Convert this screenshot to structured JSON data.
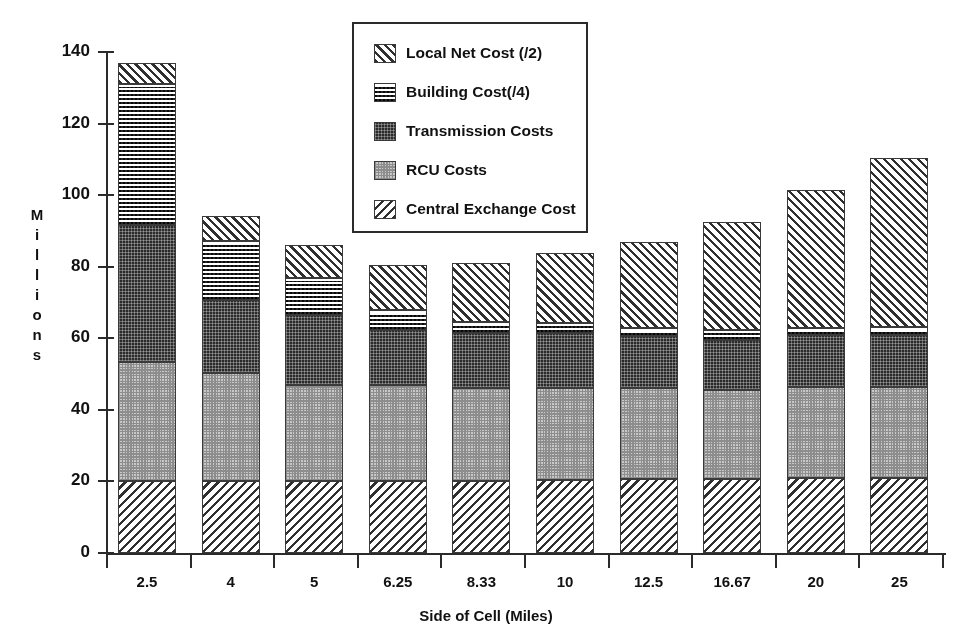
{
  "chart_data": {
    "type": "bar",
    "subtype": "stacked-bar",
    "title": "",
    "xlabel": "Side of Cell (Miles)",
    "ylabel": "Millions",
    "categories": [
      "2.5",
      "4",
      "5",
      "6.25",
      "8.33",
      "10",
      "12.5",
      "16.67",
      "20",
      "25"
    ],
    "ylim": [
      0,
      140
    ],
    "yticks": [
      0,
      20,
      40,
      60,
      80,
      100,
      120,
      140
    ],
    "grid": false,
    "legend_position": "top-center",
    "series": [
      {
        "name": "Central Exchange Cost",
        "pattern": "diagonal-hatch-back",
        "values": [
          20,
          20,
          20,
          20,
          20,
          20.5,
          20.7,
          20.7,
          20.9,
          21
        ]
      },
      {
        "name": "RCU Costs",
        "pattern": "fine-dot-light",
        "values": [
          33.4,
          30.3,
          26.9,
          26.9,
          26.1,
          25.6,
          25.4,
          24.8,
          25.5,
          25.4
        ]
      },
      {
        "name": "Transmission Costs",
        "pattern": "dense-dot-dark",
        "values": [
          38.2,
          20.4,
          19.6,
          15.4,
          15.4,
          15.4,
          14.5,
          14.0,
          14.5,
          14.5
        ]
      },
      {
        "name": "Building Cost(/4)",
        "pattern": "checkerboard",
        "values": [
          39.4,
          16.5,
          10.3,
          5.6,
          3.0,
          2.7,
          2.2,
          2.8,
          1.9,
          2.2
        ]
      },
      {
        "name": "Local Net Cost (/2)",
        "pattern": "diagonal-hatch-fwd",
        "values": [
          6.0,
          6.9,
          9.2,
          12.5,
          16.5,
          19.6,
          24.1,
          30.2,
          38.6,
          47.2
        ]
      }
    ],
    "totals": [
      137.0,
      94.1,
      86.0,
      80.4,
      81.0,
      83.8,
      86.9,
      92.5,
      101.4,
      110.3
    ]
  },
  "legend": {
    "items": [
      {
        "label": "Local Net Cost (/2)",
        "pattern": "diagonal-hatch-fwd"
      },
      {
        "label": "Building Cost(/4)",
        "pattern": "checkerboard"
      },
      {
        "label": "Transmission Costs",
        "pattern": "dense-dot-dark"
      },
      {
        "label": "RCU Costs",
        "pattern": "fine-dot-light"
      },
      {
        "label": "Central Exchange Cost",
        "pattern": "diagonal-hatch-back"
      }
    ]
  },
  "axes": {
    "y_title_letters": [
      "M",
      "i",
      "l",
      "l",
      "i",
      "o",
      "n",
      "s"
    ],
    "y_tick_labels": [
      "140",
      "120",
      "100",
      "80",
      "60",
      "40",
      "20",
      "0"
    ],
    "x_tick_labels": [
      "2.5",
      "4",
      "5",
      "6.25",
      "8.33",
      "10",
      "12.5",
      "16.67",
      "20",
      "25"
    ],
    "x_title": "Side of Cell (Miles)"
  },
  "colors": {
    "ink": "#2b2b2b",
    "dark_fill": "#2a2a2a",
    "mid_fill": "#c8c8c8",
    "background": "#ffffff"
  }
}
